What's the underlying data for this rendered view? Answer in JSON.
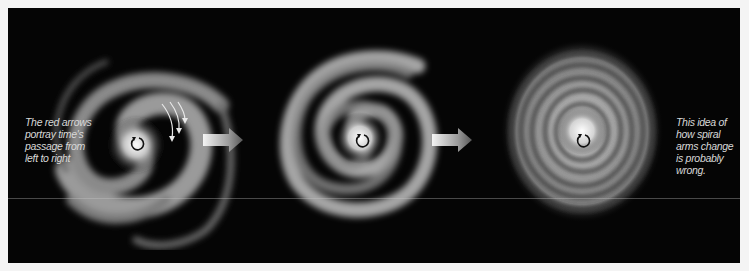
{
  "figure": {
    "caption_left": "The red arrows portray time's passage from left to right",
    "caption_right": "This idea of how spiral arms change is probably wrong.",
    "stages": [
      {
        "label": "loosely wound spiral",
        "arms": 2
      },
      {
        "label": "more tightly wound spiral",
        "arms": 2
      },
      {
        "label": "very tightly wound spiral",
        "arms": 2
      }
    ],
    "icons": {
      "rotation": "counterclockwise-rotation-icon",
      "time_arrow": "right-arrow-icon",
      "motion_lines": "motion-arrows-icon"
    },
    "colors": {
      "background": "#050505",
      "galaxy": "#d9d9d9",
      "text": "#d8d8d8",
      "page": "#f4f4f4"
    }
  }
}
